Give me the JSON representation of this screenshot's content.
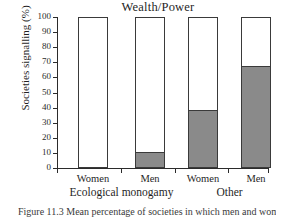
{
  "chart_data": {
    "type": "bar",
    "subtype": "stacked-bar",
    "title": "Wealth/Power",
    "xlabel": "",
    "ylabel": "Societies signalling (%)",
    "ylim": [
      0,
      100
    ],
    "yticks": [
      0,
      10,
      20,
      30,
      40,
      50,
      60,
      70,
      80,
      90,
      100
    ],
    "ytick_labels": [
      "0",
      "10",
      "20",
      "30",
      "40",
      "50",
      "60",
      "70",
      "80",
      "90",
      "100"
    ],
    "categories": [
      "Women",
      "Men",
      "Women",
      "Men"
    ],
    "groups": [
      {
        "label": "Ecological monogamy",
        "categories": [
          "Women",
          "Men"
        ]
      },
      {
        "label": "Other",
        "categories": [
          "Women",
          "Men"
        ]
      }
    ],
    "series": [
      {
        "name": "signalling",
        "color": "#8a8a8a",
        "values": [
          0,
          10,
          38,
          67
        ]
      },
      {
        "name": "not signalling",
        "color": "#ffffff",
        "values": [
          100,
          90,
          62,
          33
        ]
      }
    ],
    "bars": [
      {
        "category": "Women",
        "group": "Ecological monogamy",
        "filled_percent": 0,
        "total_percent": 100
      },
      {
        "category": "Men",
        "group": "Ecological monogamy",
        "filled_percent": 10,
        "total_percent": 100
      },
      {
        "category": "Women",
        "group": "Other",
        "filled_percent": 38,
        "total_percent": 100
      },
      {
        "category": "Men",
        "group": "Other",
        "filled_percent": 67,
        "total_percent": 100
      }
    ],
    "grid": false,
    "legend": "none",
    "colors": {
      "fill": "#8a8a8a",
      "empty": "#ffffff",
      "outline": "#3a3a3a",
      "axis": "#2b2b2b",
      "text": "#1f1f1f"
    }
  },
  "caption": {
    "text": "Figure  11.3  Mean percentage of societies in which men and women signal wealth/power."
  }
}
